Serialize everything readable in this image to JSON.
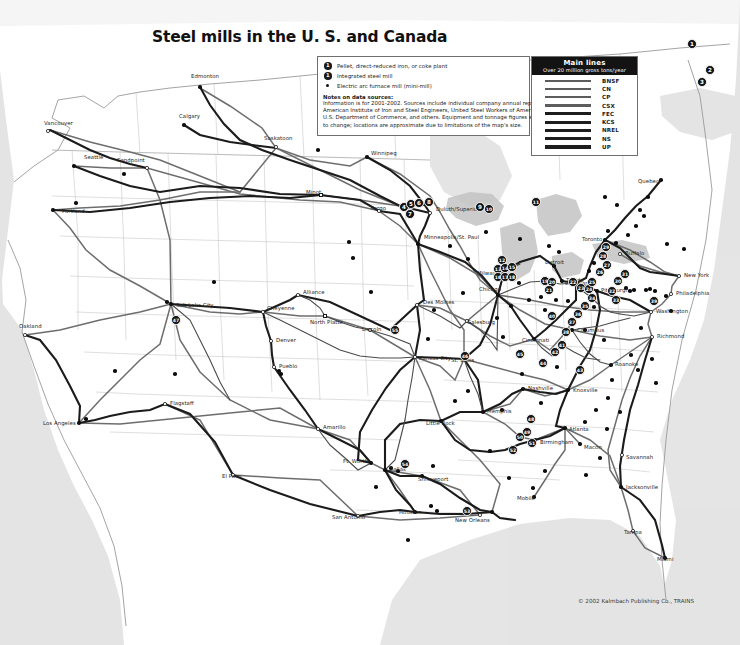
{
  "map": {
    "title": "Steel mills in the U. S. and Canada",
    "copyright": "© 2002 Kalmbach Publishing Co., TRAINS"
  },
  "symbol_legend": {
    "items": [
      {
        "symbol": "numbered-circle-icon",
        "glyph": "1",
        "label": "Pellet, direct-reduced iron, or coke plant"
      },
      {
        "symbol": "numbered-circle-icon",
        "glyph": "1",
        "label": "Integrated steel mill"
      },
      {
        "symbol": "small-dot-icon",
        "glyph": "",
        "label": "Electric arc furnace mill (mini-mill)"
      }
    ],
    "notes_title": "Notes on data sources:",
    "notes": [
      "Information is for 2001-2002. Sources include individual company annual reports,",
      "American Institute of Iron and Steel Engineers, United Steel Workers of America,",
      "U.S. Department of Commerce, and others. Equipment and tonnage figures subject",
      "to  change; locations are approximate due to limitations of the map's size."
    ]
  },
  "mainlines_legend": {
    "header": "Main lines",
    "subheader": "Over 20 million gross tons/year",
    "railroads": [
      {
        "name": "BNSF",
        "weight": "light"
      },
      {
        "name": "CN",
        "weight": "light"
      },
      {
        "name": "CP",
        "weight": "light"
      },
      {
        "name": "CSX",
        "weight": "light"
      },
      {
        "name": "FEC",
        "weight": "heavy"
      },
      {
        "name": "KCS",
        "weight": "heavy"
      },
      {
        "name": "NREL",
        "weight": "heavy"
      },
      {
        "name": "NS",
        "weight": "heavy"
      },
      {
        "name": "UP",
        "weight": "heavy"
      }
    ]
  },
  "cities": [
    {
      "name": "Vancouver",
      "x": 48,
      "y": 131,
      "lx": 44,
      "ly": 124,
      "marker": "open",
      "align": "left"
    },
    {
      "name": "Edmonton",
      "x": 200,
      "y": 87,
      "lx": 191,
      "ly": 77,
      "marker": "solid",
      "align": "left"
    },
    {
      "name": "Calgary",
      "x": 184,
      "y": 125,
      "lx": 179,
      "ly": 117,
      "marker": "solid",
      "align": "left"
    },
    {
      "name": "Seattle",
      "x": 74,
      "y": 166,
      "lx": 84,
      "ly": 158,
      "marker": "solid",
      "align": "left"
    },
    {
      "name": "Sandpoint",
      "x": 147,
      "y": 168,
      "lx": 117,
      "ly": 161,
      "marker": "open",
      "align": "left"
    },
    {
      "name": "Portland",
      "x": 53,
      "y": 210,
      "lx": 62,
      "ly": 212,
      "marker": "solid",
      "align": "left"
    },
    {
      "name": "Saskatoon",
      "x": 276,
      "y": 147,
      "lx": 264,
      "ly": 139,
      "marker": "open",
      "align": "left"
    },
    {
      "name": "Winnipeg",
      "x": 367,
      "y": 157,
      "lx": 371,
      "ly": 154,
      "marker": "solid",
      "align": "left"
    },
    {
      "name": "Minot",
      "x": 321,
      "y": 195,
      "lx": 306,
      "ly": 193,
      "marker": "sq",
      "align": "left"
    },
    {
      "name": "Fargo",
      "x": 379,
      "y": 211,
      "lx": 371,
      "ly": 209,
      "marker": "open",
      "align": "left"
    },
    {
      "name": "Duluth/Superior",
      "x": 430,
      "y": 213,
      "lx": 436,
      "ly": 210,
      "marker": "open",
      "align": "left"
    },
    {
      "name": "Minneapolis/St. Paul",
      "x": 418,
      "y": 244,
      "lx": 424,
      "ly": 238,
      "marker": "solid",
      "align": "left"
    },
    {
      "name": "Oakland",
      "x": 25,
      "y": 335,
      "lx": 19,
      "ly": 327,
      "marker": "open",
      "align": "left"
    },
    {
      "name": "Los Angeles",
      "x": 79,
      "y": 423,
      "lx": 43,
      "ly": 424,
      "marker": "solid",
      "align": "left"
    },
    {
      "name": "Salt Lake City",
      "x": 171,
      "y": 304,
      "lx": 176,
      "ly": 306,
      "marker": "solid",
      "align": "left"
    },
    {
      "name": "Flagstaff",
      "x": 165,
      "y": 404,
      "lx": 170,
      "ly": 404,
      "marker": "open",
      "align": "left"
    },
    {
      "name": "Cheyenne",
      "x": 263,
      "y": 312,
      "lx": 267,
      "ly": 309,
      "marker": "open",
      "align": "left"
    },
    {
      "name": "Alliance",
      "x": 298,
      "y": 295,
      "lx": 303,
      "ly": 293,
      "marker": "open",
      "align": "left"
    },
    {
      "name": "North Platte",
      "x": 325,
      "y": 316,
      "lx": 310,
      "ly": 323,
      "marker": "sq",
      "align": "left"
    },
    {
      "name": "Denver",
      "x": 271,
      "y": 341,
      "lx": 276,
      "ly": 341,
      "marker": "open",
      "align": "left"
    },
    {
      "name": "Pueblo",
      "x": 274,
      "y": 367,
      "lx": 279,
      "ly": 367,
      "marker": "open",
      "align": "left"
    },
    {
      "name": "Lincoln",
      "x": 370,
      "y": 330,
      "lx": 362,
      "ly": 330,
      "marker": "open",
      "align": "left"
    },
    {
      "name": "Des Moines",
      "x": 417,
      "y": 305,
      "lx": 423,
      "ly": 303,
      "marker": "open",
      "align": "left"
    },
    {
      "name": "Galesburg",
      "x": 467,
      "y": 321,
      "lx": 467,
      "ly": 323,
      "marker": "open",
      "align": "left"
    },
    {
      "name": "Kansas City",
      "x": 415,
      "y": 357,
      "lx": 419,
      "ly": 359,
      "marker": "open",
      "align": "left"
    },
    {
      "name": "St. Louis",
      "x": 464,
      "y": 359,
      "lx": 451,
      "ly": 361,
      "marker": "open",
      "align": "left"
    },
    {
      "name": "Milwaukee",
      "x": 504,
      "y": 272,
      "lx": 477,
      "ly": 274,
      "marker": "solid",
      "align": "left"
    },
    {
      "name": "Chicago",
      "x": 498,
      "y": 295,
      "lx": 479,
      "ly": 290,
      "marker": "solid",
      "align": "left"
    },
    {
      "name": "Detroit",
      "x": 554,
      "y": 266,
      "lx": 545,
      "ly": 263,
      "marker": "solid",
      "align": "left"
    },
    {
      "name": "Toledo",
      "x": 562,
      "y": 281,
      "lx": 566,
      "ly": 281,
      "marker": "solid",
      "align": "left"
    },
    {
      "name": "Toronto",
      "x": 605,
      "y": 240,
      "lx": 582,
      "ly": 240,
      "marker": "solid",
      "align": "left"
    },
    {
      "name": "Buffalo",
      "x": 620,
      "y": 254,
      "lx": 625,
      "ly": 254,
      "marker": "open",
      "align": "left"
    },
    {
      "name": "Cleveland",
      "x": 576,
      "y": 283,
      "lx": 565,
      "ly": 284,
      "marker": "solid",
      "align": "left"
    },
    {
      "name": "Pittsburgh",
      "x": 597,
      "y": 291,
      "lx": 601,
      "ly": 291,
      "marker": "solid",
      "align": "left"
    },
    {
      "name": "Columbus",
      "x": 572,
      "y": 330,
      "lx": 577,
      "ly": 331,
      "marker": "solid",
      "align": "left"
    },
    {
      "name": "New York",
      "x": 679,
      "y": 276,
      "lx": 684,
      "ly": 276,
      "marker": "open",
      "align": "left"
    },
    {
      "name": "Philadelphia",
      "x": 671,
      "y": 294,
      "lx": 676,
      "ly": 294,
      "marker": "open",
      "align": "left"
    },
    {
      "name": "Washington",
      "x": 651,
      "y": 312,
      "lx": 656,
      "ly": 312,
      "marker": "open",
      "align": "left"
    },
    {
      "name": "Richmond",
      "x": 652,
      "y": 337,
      "lx": 657,
      "ly": 337,
      "marker": "open",
      "align": "left"
    },
    {
      "name": "Quebec",
      "x": 661,
      "y": 180,
      "lx": 638,
      "ly": 182,
      "marker": "solid",
      "align": "left"
    },
    {
      "name": "Cincinnati",
      "x": 534,
      "y": 339,
      "lx": 522,
      "ly": 341,
      "marker": "solid",
      "align": "left"
    },
    {
      "name": "Roanoke",
      "x": 611,
      "y": 365,
      "lx": 615,
      "ly": 365,
      "marker": "solid",
      "align": "left"
    },
    {
      "name": "Knoxville",
      "x": 568,
      "y": 390,
      "lx": 573,
      "ly": 391,
      "marker": "solid",
      "align": "left"
    },
    {
      "name": "Nashville",
      "x": 523,
      "y": 389,
      "lx": 528,
      "ly": 389,
      "marker": "solid",
      "align": "left"
    },
    {
      "name": "Atlanta",
      "x": 565,
      "y": 428,
      "lx": 569,
      "ly": 430,
      "marker": "solid",
      "align": "left"
    },
    {
      "name": "Macon",
      "x": 580,
      "y": 444,
      "lx": 584,
      "ly": 448,
      "marker": "solid",
      "align": "left"
    },
    {
      "name": "Savannah",
      "x": 622,
      "y": 455,
      "lx": 626,
      "ly": 458,
      "marker": "open",
      "align": "left"
    },
    {
      "name": "Jacksonville",
      "x": 621,
      "y": 487,
      "lx": 626,
      "ly": 488,
      "marker": "solid",
      "align": "left"
    },
    {
      "name": "Tampa",
      "x": 633,
      "y": 531,
      "lx": 624,
      "ly": 533,
      "marker": "open",
      "align": "left"
    },
    {
      "name": "Miami",
      "x": 665,
      "y": 558,
      "lx": 657,
      "ly": 560,
      "marker": "solid",
      "align": "left"
    },
    {
      "name": "Memphis",
      "x": 483,
      "y": 412,
      "lx": 487,
      "ly": 412,
      "marker": "solid",
      "align": "left"
    },
    {
      "name": "Little Rock",
      "x": 441,
      "y": 421,
      "lx": 426,
      "ly": 424,
      "marker": "solid",
      "align": "left"
    },
    {
      "name": "Birmingham",
      "x": 535,
      "y": 440,
      "lx": 540,
      "ly": 443,
      "marker": "solid",
      "align": "left"
    },
    {
      "name": "Mobile",
      "x": 534,
      "y": 497,
      "lx": 517,
      "ly": 499,
      "marker": "solid",
      "align": "left"
    },
    {
      "name": "Dallas",
      "x": 385,
      "y": 470,
      "lx": 389,
      "ly": 470,
      "marker": "solid",
      "align": "left"
    },
    {
      "name": "Ft. Worth",
      "x": 371,
      "y": 463,
      "lx": 343,
      "ly": 462,
      "marker": "solid",
      "align": "left"
    },
    {
      "name": "Shreveport",
      "x": 422,
      "y": 476,
      "lx": 418,
      "ly": 480,
      "marker": "solid",
      "align": "left"
    },
    {
      "name": "Amarillo",
      "x": 318,
      "y": 429,
      "lx": 323,
      "ly": 428,
      "marker": "open",
      "align": "left"
    },
    {
      "name": "El Paso",
      "x": 233,
      "y": 475,
      "lx": 222,
      "ly": 477,
      "marker": "open",
      "align": "left"
    },
    {
      "name": "San Antonio",
      "x": 358,
      "y": 516,
      "lx": 332,
      "ly": 518,
      "marker": "open",
      "align": "left"
    },
    {
      "name": "Houston",
      "x": 415,
      "y": 512,
      "lx": 399,
      "ly": 513,
      "marker": "solid",
      "align": "left"
    },
    {
      "name": "New Orleans",
      "x": 480,
      "y": 515,
      "lx": 455,
      "ly": 521,
      "marker": "open",
      "align": "left"
    }
  ],
  "mill_markers": [
    {
      "n": "1",
      "x": 692,
      "y": 44
    },
    {
      "n": "2",
      "x": 710,
      "y": 70
    },
    {
      "n": "3",
      "x": 702,
      "y": 82
    },
    {
      "n": "4",
      "x": 404,
      "y": 207
    },
    {
      "n": "5",
      "x": 411,
      "y": 204
    },
    {
      "n": "6",
      "x": 419,
      "y": 203
    },
    {
      "n": "7",
      "x": 410,
      "y": 214
    },
    {
      "n": "8",
      "x": 429,
      "y": 202
    },
    {
      "n": "9",
      "x": 480,
      "y": 207
    },
    {
      "n": "10",
      "x": 489,
      "y": 209
    },
    {
      "n": "11",
      "x": 536,
      "y": 202
    },
    {
      "n": "12",
      "x": 502,
      "y": 260
    },
    {
      "n": "13",
      "x": 498,
      "y": 269
    },
    {
      "n": "14",
      "x": 505,
      "y": 268
    },
    {
      "n": "15",
      "x": 512,
      "y": 267
    },
    {
      "n": "16",
      "x": 498,
      "y": 277
    },
    {
      "n": "17",
      "x": 505,
      "y": 277
    },
    {
      "n": "18",
      "x": 512,
      "y": 277
    },
    {
      "n": "19",
      "x": 545,
      "y": 281
    },
    {
      "n": "20",
      "x": 552,
      "y": 282
    },
    {
      "n": "21",
      "x": 549,
      "y": 290
    },
    {
      "n": "22",
      "x": 573,
      "y": 282
    },
    {
      "n": "23",
      "x": 581,
      "y": 288
    },
    {
      "n": "24",
      "x": 589,
      "y": 289
    },
    {
      "n": "25",
      "x": 592,
      "y": 282
    },
    {
      "n": "26",
      "x": 600,
      "y": 272
    },
    {
      "n": "27",
      "x": 607,
      "y": 265
    },
    {
      "n": "28",
      "x": 603,
      "y": 256
    },
    {
      "n": "29",
      "x": 606,
      "y": 247
    },
    {
      "n": "30",
      "x": 618,
      "y": 281
    },
    {
      "n": "31",
      "x": 625,
      "y": 274
    },
    {
      "n": "32",
      "x": 612,
      "y": 291
    },
    {
      "n": "33",
      "x": 616,
      "y": 300
    },
    {
      "n": "34",
      "x": 592,
      "y": 298
    },
    {
      "n": "35",
      "x": 585,
      "y": 306
    },
    {
      "n": "36",
      "x": 578,
      "y": 314
    },
    {
      "n": "37",
      "x": 572,
      "y": 322
    },
    {
      "n": "38",
      "x": 566,
      "y": 332
    },
    {
      "n": "39",
      "x": 654,
      "y": 301
    },
    {
      "n": "40",
      "x": 552,
      "y": 316
    },
    {
      "n": "41",
      "x": 562,
      "y": 345
    },
    {
      "n": "42",
      "x": 555,
      "y": 352
    },
    {
      "n": "43",
      "x": 580,
      "y": 370
    },
    {
      "n": "44",
      "x": 543,
      "y": 363
    },
    {
      "n": "45",
      "x": 520,
      "y": 354
    },
    {
      "n": "46",
      "x": 465,
      "y": 356
    },
    {
      "n": "47",
      "x": 176,
      "y": 320
    },
    {
      "n": "48",
      "x": 531,
      "y": 419
    },
    {
      "n": "49",
      "x": 527,
      "y": 432
    },
    {
      "n": "50",
      "x": 520,
      "y": 437
    },
    {
      "n": "51",
      "x": 532,
      "y": 443
    },
    {
      "n": "52",
      "x": 513,
      "y": 450
    },
    {
      "n": "53",
      "x": 467,
      "y": 511
    },
    {
      "n": "54",
      "x": 405,
      "y": 464
    },
    {
      "n": "55",
      "x": 395,
      "y": 330
    }
  ],
  "minimills": [
    {
      "x": 167,
      "y": 302
    },
    {
      "x": 115,
      "y": 371
    },
    {
      "x": 214,
      "y": 282
    },
    {
      "x": 279,
      "y": 371
    },
    {
      "x": 353,
      "y": 258
    },
    {
      "x": 371,
      "y": 292
    },
    {
      "x": 349,
      "y": 242
    },
    {
      "x": 318,
      "y": 150
    },
    {
      "x": 434,
      "y": 310
    },
    {
      "x": 463,
      "y": 293
    },
    {
      "x": 486,
      "y": 232
    },
    {
      "x": 497,
      "y": 318
    },
    {
      "x": 519,
      "y": 283
    },
    {
      "x": 529,
      "y": 300
    },
    {
      "x": 541,
      "y": 297
    },
    {
      "x": 511,
      "y": 306
    },
    {
      "x": 545,
      "y": 310
    },
    {
      "x": 556,
      "y": 300
    },
    {
      "x": 568,
      "y": 301
    },
    {
      "x": 594,
      "y": 307
    },
    {
      "x": 626,
      "y": 288
    },
    {
      "x": 630,
      "y": 291
    },
    {
      "x": 634,
      "y": 290
    },
    {
      "x": 646,
      "y": 290
    },
    {
      "x": 650,
      "y": 289
    },
    {
      "x": 655,
      "y": 291
    },
    {
      "x": 666,
      "y": 296
    },
    {
      "x": 640,
      "y": 210
    },
    {
      "x": 644,
      "y": 216
    },
    {
      "x": 636,
      "y": 226
    },
    {
      "x": 628,
      "y": 235
    },
    {
      "x": 616,
      "y": 243
    },
    {
      "x": 608,
      "y": 231
    },
    {
      "x": 594,
      "y": 263
    },
    {
      "x": 589,
      "y": 271
    },
    {
      "x": 585,
      "y": 330
    },
    {
      "x": 604,
      "y": 340
    },
    {
      "x": 631,
      "y": 355
    },
    {
      "x": 638,
      "y": 370
    },
    {
      "x": 612,
      "y": 380
    },
    {
      "x": 608,
      "y": 398
    },
    {
      "x": 620,
      "y": 412
    },
    {
      "x": 596,
      "y": 410
    },
    {
      "x": 585,
      "y": 422
    },
    {
      "x": 607,
      "y": 429
    },
    {
      "x": 541,
      "y": 403
    },
    {
      "x": 502,
      "y": 410
    },
    {
      "x": 545,
      "y": 471
    },
    {
      "x": 509,
      "y": 478
    },
    {
      "x": 492,
      "y": 512
    },
    {
      "x": 437,
      "y": 511
    },
    {
      "x": 431,
      "y": 506
    },
    {
      "x": 408,
      "y": 540
    },
    {
      "x": 376,
      "y": 487
    },
    {
      "x": 433,
      "y": 466
    },
    {
      "x": 455,
      "y": 401
    },
    {
      "x": 468,
      "y": 391
    },
    {
      "x": 428,
      "y": 339
    },
    {
      "x": 503,
      "y": 337
    },
    {
      "x": 557,
      "y": 367
    },
    {
      "x": 522,
      "y": 374
    },
    {
      "x": 490,
      "y": 451
    },
    {
      "x": 533,
      "y": 488
    },
    {
      "x": 424,
      "y": 204
    },
    {
      "x": 450,
      "y": 246
    },
    {
      "x": 468,
      "y": 259
    },
    {
      "x": 520,
      "y": 239
    },
    {
      "x": 549,
      "y": 246
    },
    {
      "x": 559,
      "y": 252
    },
    {
      "x": 605,
      "y": 197
    },
    {
      "x": 617,
      "y": 205
    },
    {
      "x": 648,
      "y": 197
    },
    {
      "x": 667,
      "y": 244
    },
    {
      "x": 684,
      "y": 249
    },
    {
      "x": 671,
      "y": 311
    },
    {
      "x": 641,
      "y": 328
    },
    {
      "x": 652,
      "y": 359
    },
    {
      "x": 656,
      "y": 383
    },
    {
      "x": 600,
      "y": 458
    },
    {
      "x": 586,
      "y": 475
    },
    {
      "x": 124,
      "y": 174
    },
    {
      "x": 76,
      "y": 203
    },
    {
      "x": 86,
      "y": 419
    },
    {
      "x": 175,
      "y": 374
    },
    {
      "x": 281,
      "y": 374
    },
    {
      "x": 391,
      "y": 468
    },
    {
      "x": 398,
      "y": 471
    }
  ]
}
